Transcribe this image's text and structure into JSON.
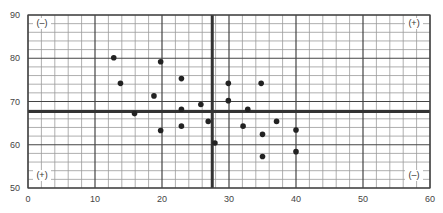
{
  "chart_data": {
    "type": "scatter",
    "title": "",
    "xlabel": "",
    "ylabel": "",
    "xlim": [
      0,
      60
    ],
    "ylim": [
      50,
      90
    ],
    "x_ticks": [
      0,
      10,
      20,
      30,
      40,
      50,
      60
    ],
    "y_ticks": [
      50,
      60,
      70,
      80,
      90
    ],
    "minor_step_x": 2,
    "minor_step_y": 2,
    "grid": true,
    "legend": null,
    "reference_lines": {
      "vertical_x": 27.5,
      "horizontal_y": 67.7
    },
    "quadrant_labels": [
      {
        "position": "top-left",
        "text": "(–)"
      },
      {
        "position": "top-right",
        "text": "(+)"
      },
      {
        "position": "bottom-left",
        "text": "(+)"
      },
      {
        "position": "bottom-right",
        "text": "(–)"
      }
    ],
    "points": [
      {
        "x": 12.8,
        "y": 80.1
      },
      {
        "x": 13.8,
        "y": 74.2
      },
      {
        "x": 15.9,
        "y": 67.2
      },
      {
        "x": 18.8,
        "y": 71.3
      },
      {
        "x": 19.8,
        "y": 79.2
      },
      {
        "x": 19.8,
        "y": 63.3
      },
      {
        "x": 22.9,
        "y": 75.3
      },
      {
        "x": 22.9,
        "y": 68.2
      },
      {
        "x": 22.9,
        "y": 64.3
      },
      {
        "x": 25.8,
        "y": 69.3
      },
      {
        "x": 26.9,
        "y": 65.4
      },
      {
        "x": 27.9,
        "y": 60.4
      },
      {
        "x": 29.9,
        "y": 74.2
      },
      {
        "x": 29.9,
        "y": 70.2
      },
      {
        "x": 32.1,
        "y": 64.3
      },
      {
        "x": 32.8,
        "y": 68.2
      },
      {
        "x": 34.8,
        "y": 74.2
      },
      {
        "x": 35.0,
        "y": 62.4
      },
      {
        "x": 35.0,
        "y": 57.3
      },
      {
        "x": 37.1,
        "y": 65.4
      },
      {
        "x": 40.0,
        "y": 63.4
      },
      {
        "x": 40.0,
        "y": 58.4
      }
    ]
  },
  "colors": {
    "grid_minor": "#9a9a9a",
    "grid_major": "#444444",
    "reference_line": "#333333",
    "point": "#222222",
    "tick_text": "#444444"
  }
}
